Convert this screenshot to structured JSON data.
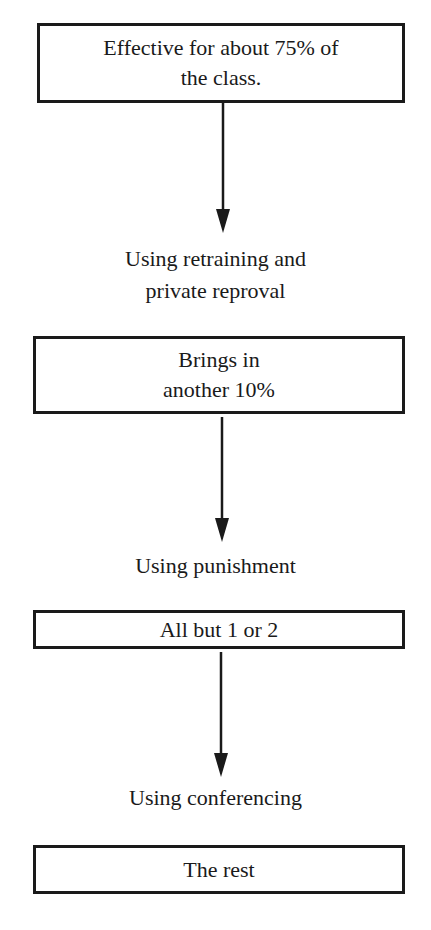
{
  "flowchart": {
    "steps": [
      {
        "box_text": "Effective for about 75% of\nthe class."
      },
      {
        "transition_label": "Using retraining and\nprivate reproval",
        "box_text": "Brings in\nanother 10%"
      },
      {
        "transition_label": "Using punishment",
        "box_text": "All but 1 or 2"
      },
      {
        "transition_label": "Using conferencing",
        "box_text": "The rest"
      }
    ],
    "colors": {
      "stroke": "#1a1a1a",
      "background": "#ffffff"
    }
  }
}
